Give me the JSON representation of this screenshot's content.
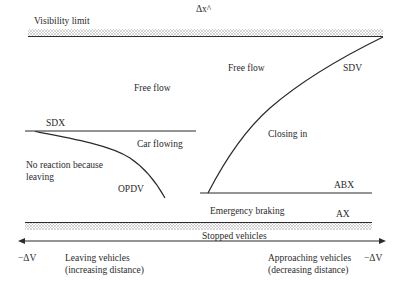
{
  "diagram": {
    "top_axis_label": "Δx^",
    "labels": {
      "visibility_limit": "Visibility limit",
      "free_flow_left": "Free flow",
      "free_flow_right": "Free flow",
      "sdx": "SDX",
      "sdv": "SDV",
      "car_flowing": "Car flowing",
      "closing_in": "Closing in",
      "no_reaction_line1": "No reaction because",
      "no_reaction_line2": "leaving",
      "opdv": "OPDV",
      "abx": "ABX",
      "emergency_braking": "Emergency braking",
      "ax": "AX",
      "stopped_vehicles": "Stopped vehicles",
      "left_axis_end": "−ΔV",
      "right_axis_end": "−ΔV",
      "leaving_line1": "Leaving vehicles",
      "leaving_line2": "(increasing distance)",
      "approaching_line1": "Approaching vehicles",
      "approaching_line2": "(decreasing distance)"
    },
    "colors": {
      "line": "#2b2b2b",
      "hatch": "#9a9a9a"
    }
  }
}
